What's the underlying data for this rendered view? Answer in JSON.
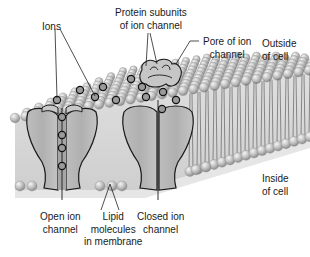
{
  "diagram": {
    "labels": {
      "ions": [
        "Ions"
      ],
      "protein_subunits": [
        "Protein subunits",
        "of ion channel"
      ],
      "pore": [
        "Pore of ion",
        "channel"
      ],
      "outside": [
        "Outside",
        "of cell"
      ],
      "inside": [
        "Inside",
        "of cell"
      ],
      "open_channel": [
        "Open ion",
        "channel"
      ],
      "lipid": [
        "Lipid",
        "molecules",
        "in membrane"
      ],
      "closed_channel": [
        "Closed ion",
        "channel"
      ]
    },
    "colors": {
      "background": "#ffffff",
      "membrane_fill": "#d9d9d9",
      "lipid_head": "#bdbdbd",
      "lipid_head_highlight": "#efefef",
      "protein_fill": "#b8b8b8",
      "protein_outline": "#1a1a1a",
      "ion_fill": "#9a9a9a",
      "ion_outline": "#111111",
      "leader_line": "#222222"
    }
  }
}
